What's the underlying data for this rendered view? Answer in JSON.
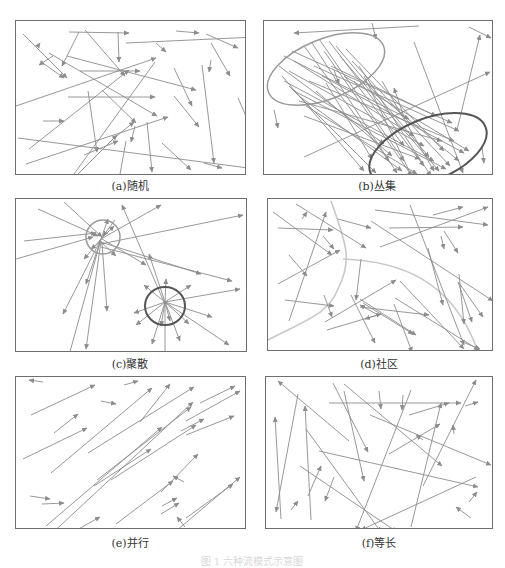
{
  "figure_caption": "图 1  六种流模式示意图",
  "colors": {
    "line": "#8c8c8c",
    "border": "#6e6e6e",
    "dark_ellipse": "#555555",
    "light_ellipse": "#9a9a9a",
    "community_curve": "#c8c8c8"
  },
  "panels": [
    {
      "id": "a",
      "caption": "(a)随机",
      "x": 15,
      "y": 20,
      "w": 231,
      "h": 155,
      "caption_x": 130,
      "caption_y": 177,
      "arrows": [
        [
          7,
          13,
          51,
          57
        ],
        [
          53,
          11,
          113,
          12,
          0
        ],
        [
          22,
          25,
          24,
          22
        ],
        [
          69,
          9,
          109,
          55
        ],
        [
          63,
          11,
          46,
          45
        ],
        [
          102,
          11,
          103,
          41
        ],
        [
          37,
          35,
          23,
          44
        ],
        [
          24,
          40,
          48,
          57
        ],
        [
          64,
          50,
          124,
          50
        ],
        [
          190,
          13,
          222,
          27,
          0
        ],
        [
          51,
          35,
          180,
          69,
          0
        ],
        [
          33,
          32,
          141,
          95
        ],
        [
          160,
          10,
          183,
          12
        ],
        [
          140,
          22,
          150,
          31
        ],
        [
          195,
          22,
          214,
          55
        ],
        [
          195,
          39,
          193,
          51
        ],
        [
          0,
          85,
          140,
          37
        ],
        [
          110,
          22,
          240,
          16,
          0
        ],
        [
          27,
          100,
          48,
          100
        ],
        [
          52,
          76,
          139,
          76
        ],
        [
          86,
          69,
          120,
          102
        ],
        [
          72,
          70,
          81,
          131
        ],
        [
          158,
          47,
          176,
          85
        ],
        [
          222,
          77,
          241,
          120
        ],
        [
          139,
          41,
          53,
          160
        ],
        [
          60,
          155,
          101,
          114,
          0
        ],
        [
          13,
          128,
          113,
          49
        ],
        [
          10,
          143,
          152,
          96,
          0
        ],
        [
          158,
          75,
          183,
          106
        ],
        [
          186,
          44,
          198,
          142
        ],
        [
          98,
          117,
          118,
          101,
          0
        ],
        [
          119,
          105,
          115,
          121
        ],
        [
          68,
          134,
          102,
          120
        ],
        [
          146,
          122,
          175,
          149,
          0
        ],
        [
          188,
          142,
          206,
          147
        ],
        [
          2,
          117,
          240,
          148,
          0
        ],
        [
          131,
          101,
          136,
          151,
          0
        ],
        [
          110,
          120,
          103,
          159
        ]
      ],
      "ellipses": []
    },
    {
      "id": "b",
      "caption": "(b)丛集",
      "x": 263,
      "y": 20,
      "w": 230,
      "h": 155,
      "caption_x": 377,
      "caption_y": 177,
      "arrows": [
        [
          155,
          5,
          30,
          12
        ],
        [
          108,
          2,
          112,
          18
        ],
        [
          205,
          6,
          227,
          17
        ],
        [
          70,
          49,
          75,
          63
        ],
        [
          10,
          89,
          14,
          107
        ],
        [
          150,
          21,
          199,
          152
        ],
        [
          140,
          96,
          130,
          67
        ],
        [
          40,
          136,
          226,
          51
        ],
        [
          218,
          126,
          220,
          142
        ],
        [
          193,
          109,
          216,
          14,
          0
        ],
        [
          40,
          25,
          125,
          140
        ],
        [
          48,
          22,
          133,
          152
        ],
        [
          55,
          18,
          140,
          140
        ],
        [
          60,
          30,
          148,
          155
        ],
        [
          65,
          20,
          160,
          145
        ],
        [
          72,
          25,
          165,
          136
        ],
        [
          76,
          35,
          175,
          150
        ],
        [
          82,
          28,
          180,
          130
        ],
        [
          88,
          40,
          186,
          145
        ],
        [
          30,
          40,
          150,
          115
        ],
        [
          25,
          50,
          160,
          125
        ],
        [
          20,
          60,
          170,
          140
        ],
        [
          30,
          70,
          182,
          148
        ],
        [
          35,
          80,
          178,
          120
        ],
        [
          45,
          60,
          190,
          120
        ],
        [
          50,
          45,
          195,
          110
        ],
        [
          58,
          55,
          200,
          132
        ],
        [
          15,
          45,
          120,
          123
        ],
        [
          18,
          55,
          100,
          150
        ],
        [
          25,
          65,
          112,
          152
        ],
        [
          35,
          75,
          138,
          150
        ],
        [
          42,
          85,
          153,
          153
        ],
        [
          20,
          35,
          145,
          98
        ],
        [
          28,
          30,
          188,
          102
        ],
        [
          67,
          45,
          172,
          95
        ],
        [
          80,
          55,
          205,
          130
        ],
        [
          90,
          60,
          140,
          125
        ],
        [
          95,
          45,
          167,
          155
        ],
        [
          100,
          55,
          150,
          160
        ],
        [
          62,
          62,
          108,
          138
        ],
        [
          52,
          70,
          128,
          135
        ],
        [
          40,
          95,
          156,
          138
        ],
        [
          110,
          70,
          195,
          140
        ],
        [
          118,
          60,
          170,
          150
        ]
      ],
      "ellipses": [
        {
          "cx": 62,
          "cy": 48,
          "rx": 62,
          "ry": 30,
          "rot": -22,
          "color": "light"
        },
        {
          "cx": 164,
          "cy": 129,
          "rx": 62,
          "ry": 31,
          "rot": -22,
          "color": "dark"
        }
      ]
    },
    {
      "id": "c",
      "caption": "(c)聚散",
      "x": 15,
      "y": 198,
      "w": 232,
      "h": 154,
      "caption_x": 130,
      "caption_y": 355,
      "arrows": [
        [
          48,
          3,
          86,
          38
        ],
        [
          22,
          10,
          82,
          37
        ],
        [
          8,
          42,
          80,
          34
        ],
        [
          0,
          60,
          77,
          38
        ],
        [
          85,
          43,
          185,
          75,
          0
        ],
        [
          85,
          40,
          145,
          6,
          0
        ],
        [
          85,
          45,
          227,
          16,
          0
        ],
        [
          85,
          48,
          216,
          82,
          0
        ],
        [
          99,
          21,
          87,
          37
        ],
        [
          85,
          40,
          70,
          85
        ],
        [
          85,
          40,
          47,
          115
        ],
        [
          85,
          40,
          52,
          160
        ],
        [
          85,
          42,
          70,
          150
        ],
        [
          86,
          44,
          91,
          112
        ],
        [
          84,
          42,
          100,
          57
        ],
        [
          85,
          40,
          68,
          60
        ],
        [
          85,
          40,
          98,
          27
        ],
        [
          85,
          42,
          75,
          50
        ],
        [
          85,
          40,
          92,
          20,
          0
        ],
        [
          86,
          40,
          130,
          66
        ],
        [
          148,
          103,
          106,
          6
        ],
        [
          149,
          103,
          133,
          55
        ],
        [
          149,
          104,
          150,
          80
        ],
        [
          149,
          103,
          128,
          86
        ],
        [
          149,
          103,
          175,
          86
        ],
        [
          149,
          103,
          224,
          90
        ],
        [
          149,
          103,
          118,
          114
        ],
        [
          149,
          103,
          120,
          126
        ],
        [
          149,
          103,
          196,
          118
        ],
        [
          149,
          103,
          213,
          146
        ],
        [
          149,
          103,
          164,
          142
        ],
        [
          149,
          103,
          136,
          145
        ],
        [
          149,
          103,
          149,
          158
        ],
        [
          149,
          103,
          173,
          125
        ],
        [
          149,
          103,
          145,
          127
        ],
        [
          149,
          103,
          154,
          122
        ]
      ],
      "ellipses": [
        {
          "cx": 87,
          "cy": 38,
          "rx": 17,
          "ry": 17,
          "rot": 0,
          "color": "light"
        },
        {
          "cx": 149,
          "cy": 107,
          "rx": 20,
          "ry": 19,
          "rot": 0,
          "color": "dark"
        }
      ]
    },
    {
      "id": "d",
      "caption": "(d)社区",
      "x": 267,
      "y": 198,
      "w": 226,
      "h": 153,
      "caption_x": 379,
      "caption_y": 355,
      "arrows": [
        [
          5,
          13,
          64,
          56
        ],
        [
          10,
          29,
          65,
          31
        ],
        [
          34,
          20,
          39,
          13
        ],
        [
          21,
          56,
          39,
          77
        ],
        [
          10,
          85,
          72,
          51
        ],
        [
          21,
          122,
          58,
          13
        ],
        [
          17,
          101,
          66,
          107
        ],
        [
          56,
          96,
          64,
          118
        ],
        [
          59,
          131,
          113,
          115
        ],
        [
          28,
          5,
          98,
          49
        ],
        [
          70,
          20,
          103,
          29
        ],
        [
          55,
          37,
          66,
          50
        ],
        [
          112,
          48,
          220,
          8
        ],
        [
          107,
          11,
          220,
          26
        ],
        [
          103,
          22,
          225,
          102,
          0
        ],
        [
          121,
          29,
          195,
          28
        ],
        [
          165,
          16,
          195,
          8,
          0
        ],
        [
          142,
          6,
          196,
          146
        ],
        [
          176,
          32,
          190,
          54
        ],
        [
          173,
          37,
          176,
          50
        ],
        [
          160,
          49,
          175,
          106
        ],
        [
          191,
          75,
          196,
          125
        ],
        [
          191,
          84,
          215,
          118
        ],
        [
          93,
          60,
          88,
          101
        ],
        [
          57,
          123,
          128,
          81
        ],
        [
          95,
          104,
          145,
          135
        ],
        [
          92,
          100,
          148,
          136,
          0
        ],
        [
          92,
          108,
          161,
          116
        ],
        [
          110,
          116,
          92,
          106
        ],
        [
          113,
          115,
          97,
          120
        ],
        [
          126,
          105,
          144,
          153,
          0
        ],
        [
          132,
          82,
          196,
          150
        ],
        [
          83,
          96,
          107,
          144
        ],
        [
          127,
          99,
          211,
          151
        ],
        [
          190,
          83,
          204,
          123
        ],
        [
          192,
          142,
          212,
          150
        ]
      ],
      "curves": [
        "M0,141 C40,120 60,115 70,90 C85,60 78,45 63,2",
        "M75,60 C130,62 185,80 210,153"
      ],
      "ellipses": []
    },
    {
      "id": "e",
      "caption": "(e)并行",
      "x": 15,
      "y": 376,
      "w": 231,
      "h": 153,
      "caption_x": 130,
      "caption_y": 534,
      "arrows": [
        [
          15,
          38,
          79,
          8
        ],
        [
          38,
          56,
          62,
          37
        ],
        [
          7,
          82,
          71,
          51
        ],
        [
          35,
          96,
          136,
          11
        ],
        [
          108,
          8,
          122,
          4,
          0
        ],
        [
          85,
          24,
          100,
          27,
          0
        ],
        [
          124,
          45,
          154,
          7
        ],
        [
          72,
          76,
          178,
          10
        ],
        [
          184,
          26,
          219,
          9
        ],
        [
          78,
          109,
          135,
          72
        ],
        [
          81,
          103,
          175,
          30
        ],
        [
          165,
          54,
          188,
          42
        ],
        [
          145,
          115,
          182,
          77
        ],
        [
          30,
          149,
          146,
          50
        ],
        [
          30,
          162,
          177,
          25
        ],
        [
          170,
          44,
          224,
          14
        ],
        [
          170,
          58,
          218,
          39
        ],
        [
          95,
          103,
          180,
          48
        ],
        [
          27,
          5,
          13,
          3,
          0
        ],
        [
          14,
          119,
          34,
          122,
          0
        ],
        [
          26,
          127,
          48,
          126,
          0
        ],
        [
          100,
          147,
          157,
          104
        ],
        [
          170,
          141,
          217,
          107
        ],
        [
          59,
          154,
          84,
          140
        ],
        [
          168,
          105,
          157,
          99
        ],
        [
          146,
          129,
          161,
          121,
          0
        ],
        [
          145,
          137,
          163,
          126
        ],
        [
          169,
          150,
          161,
          140
        ],
        [
          160,
          154,
          224,
          100
        ]
      ],
      "ellipses": []
    },
    {
      "id": "f",
      "caption": "(f)等长",
      "x": 265,
      "y": 376,
      "w": 228,
      "h": 153,
      "caption_x": 379,
      "caption_y": 534,
      "arrows": [
        [
          83,
          64,
          12,
          4
        ],
        [
          32,
          17,
          10,
          135
        ],
        [
          15,
          142,
          9,
          40
        ],
        [
          63,
          26,
          195,
          26
        ],
        [
          40,
          52,
          115,
          155
        ],
        [
          45,
          143,
          39,
          29
        ],
        [
          67,
          6,
          102,
          75
        ],
        [
          42,
          119,
          55,
          89
        ],
        [
          68,
          100,
          59,
          124
        ],
        [
          34,
          89,
          131,
          155
        ],
        [
          78,
          14,
          98,
          104
        ],
        [
          145,
          13,
          90,
          154
        ],
        [
          53,
          74,
          212,
          110
        ],
        [
          104,
          38,
          225,
          88
        ],
        [
          78,
          7,
          176,
          89
        ],
        [
          123,
          77,
          174,
          47
        ],
        [
          143,
          38,
          183,
          26
        ],
        [
          145,
          150,
          175,
          26
        ],
        [
          157,
          109,
          210,
          3
        ],
        [
          25,
          133,
          32,
          124
        ],
        [
          210,
          100,
          95,
          153
        ],
        [
          203,
          125,
          211,
          115
        ],
        [
          205,
          141,
          190,
          130
        ],
        [
          199,
          29,
          212,
          25
        ],
        [
          113,
          14,
          115,
          32
        ],
        [
          188,
          57,
          187,
          48
        ],
        [
          137,
          18,
          136,
          33
        ],
        [
          157,
          63,
          150,
          58
        ]
      ],
      "ellipses": []
    }
  ]
}
